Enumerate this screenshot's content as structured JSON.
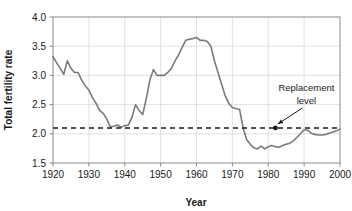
{
  "chart_data": {
    "type": "line",
    "title": "",
    "xlabel": "Year",
    "ylabel": "Total fertility rate",
    "xlim": [
      1920,
      2000
    ],
    "ylim": [
      1.5,
      4.0
    ],
    "xticks": [
      "1920",
      "1930",
      "1940",
      "1950",
      "1960",
      "1970",
      "1980",
      "1990",
      "2000"
    ],
    "yticks": [
      "1.5",
      "2.0",
      "2.5",
      "3.0",
      "3.5",
      "4.0"
    ],
    "grid": true,
    "legend_position": "none",
    "line_color": "#7a7a7a",
    "grid_color": "#d9d9d9",
    "axis_color": "#8a8a8a",
    "series": [
      {
        "name": "Total fertility rate",
        "x": [
          1920,
          1921,
          1922,
          1923,
          1924,
          1925,
          1926,
          1927,
          1928,
          1929,
          1930,
          1931,
          1932,
          1933,
          1934,
          1935,
          1936,
          1937,
          1938,
          1939,
          1940,
          1941,
          1942,
          1943,
          1944,
          1945,
          1946,
          1947,
          1948,
          1949,
          1950,
          1951,
          1952,
          1953,
          1954,
          1955,
          1956,
          1957,
          1958,
          1959,
          1960,
          1961,
          1962,
          1963,
          1964,
          1965,
          1966,
          1967,
          1968,
          1969,
          1970,
          1971,
          1972,
          1973,
          1974,
          1975,
          1976,
          1977,
          1978,
          1979,
          1980,
          1981,
          1982,
          1983,
          1984,
          1985,
          1986,
          1987,
          1988,
          1989,
          1990,
          1991,
          1992,
          1993,
          1994,
          1995,
          1996,
          1997,
          1998,
          1999,
          2000
        ],
        "values": [
          3.32,
          3.22,
          3.12,
          3.02,
          3.25,
          3.12,
          3.05,
          3.05,
          2.92,
          2.82,
          2.75,
          2.62,
          2.52,
          2.4,
          2.35,
          2.25,
          2.12,
          2.13,
          2.15,
          2.11,
          2.14,
          2.15,
          2.28,
          2.5,
          2.4,
          2.33,
          2.6,
          2.92,
          3.1,
          3.0,
          3.0,
          3.0,
          3.05,
          3.12,
          3.25,
          3.35,
          3.48,
          3.6,
          3.62,
          3.63,
          3.65,
          3.6,
          3.6,
          3.58,
          3.5,
          3.25,
          3.05,
          2.85,
          2.65,
          2.52,
          2.45,
          2.43,
          2.42,
          2.1,
          1.9,
          1.82,
          1.76,
          1.74,
          1.79,
          1.74,
          1.78,
          1.8,
          1.78,
          1.77,
          1.8,
          1.82,
          1.84,
          1.88,
          1.94,
          2.0,
          2.07,
          2.06,
          2.01,
          1.99,
          1.98,
          1.98,
          1.99,
          2.01,
          2.03,
          2.05,
          2.08
        ]
      }
    ],
    "reference_line": {
      "label_line1": "Replacement",
      "label_line2": "level",
      "value": 2.1,
      "marker_x": 1982,
      "style": "dashed",
      "color": "#1a1a1a"
    }
  }
}
